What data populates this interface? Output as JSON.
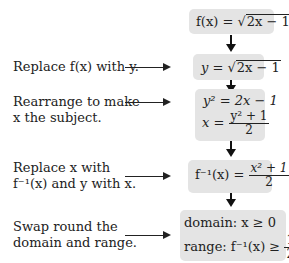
{
  "steps": [
    {
      "label": "",
      "expression": {
        "lhs": "f(x)",
        "eq": "=",
        "sqrt_arg": "2x − 1"
      }
    },
    {
      "label": "Replace f(x) with y.",
      "expression": {
        "lhs": "y",
        "eq": "=",
        "sqrt_arg": "2x − 1"
      }
    },
    {
      "label_line1": "Rearrange to make",
      "label_line2": "x the subject.",
      "expression_line1": "y² = 2x − 1",
      "expression_line2": {
        "lhs": "x =",
        "numerator": "y² + 1",
        "denominator": "2"
      }
    },
    {
      "label_line1": "Replace x with",
      "label_line2": "f⁻¹(x) and y with x.",
      "expression": {
        "lhs": "f⁻¹(x) =",
        "numerator": "x² + 1",
        "denominator": "2"
      }
    },
    {
      "label_line1": "Swap round the",
      "label_line2": "domain and range.",
      "domain": "domain: x ≥ 0",
      "range": {
        "prefix": "range: f⁻¹(x) ≥",
        "numerator": "1",
        "denominator": "2"
      }
    }
  ],
  "colors": {
    "box_fill": "#e4e4e4",
    "text": "#222222",
    "arrow": "#111111"
  }
}
